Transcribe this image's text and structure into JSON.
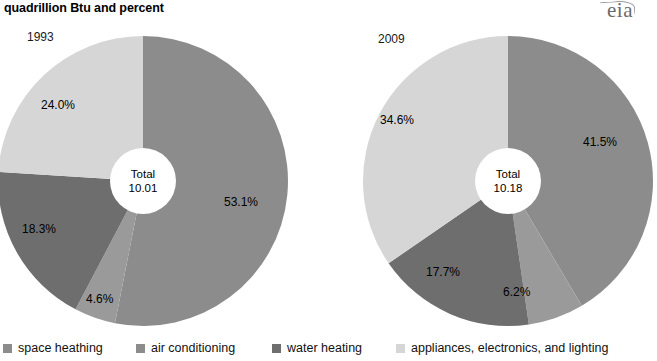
{
  "header": {
    "title": "quadrillion Btu and percent",
    "logo": "eia"
  },
  "legend": {
    "items": [
      {
        "label": "space heathing",
        "color": "#8c8c8c"
      },
      {
        "label": "air conditioning",
        "color": "#8c8c8c"
      },
      {
        "label": "water heating",
        "color": "#6e6e6e"
      },
      {
        "label": "appliances, electronics, and lighting",
        "color": "#d6d6d6"
      }
    ]
  },
  "chart_data": [
    {
      "type": "pie",
      "title": "1993",
      "center_label_line1": "Total",
      "center_label_line2": "10.01",
      "total": 10.01,
      "categories": [
        "space heathing",
        "air conditioning",
        "water heating",
        "appliances, electronics, and lighting"
      ],
      "values": [
        53.1,
        4.6,
        18.3,
        24.0
      ],
      "labels": [
        "53.1%",
        "4.6%",
        "18.3%",
        "24.0%"
      ],
      "colors": [
        "#8c8c8c",
        "#9a9a9a",
        "#6e6e6e",
        "#d6d6d6"
      ],
      "start_angle_deg": 0,
      "direction": "clockwise",
      "donut": true
    },
    {
      "type": "pie",
      "title": "2009",
      "center_label_line1": "Total",
      "center_label_line2": "10.18",
      "total": 10.18,
      "categories": [
        "space heathing",
        "air conditioning",
        "water heating",
        "appliances, electronics, and lighting"
      ],
      "values": [
        41.5,
        6.2,
        17.7,
        34.6
      ],
      "labels": [
        "41.5%",
        "6.2%",
        "17.7%",
        "34.6%"
      ],
      "colors": [
        "#8c8c8c",
        "#9a9a9a",
        "#6e6e6e",
        "#d6d6d6"
      ],
      "start_angle_deg": 0,
      "direction": "clockwise",
      "donut": true
    }
  ],
  "pies": {
    "left": {
      "year": "1993",
      "center_line1": "Total",
      "center_line2": "10.01",
      "slice_labels": {
        "space_heating": "53.1%",
        "air_conditioning": "4.6%",
        "water_heating": "18.3%",
        "appliances": "24.0%"
      }
    },
    "right": {
      "year": "2009",
      "center_line1": "Total",
      "center_line2": "10.18",
      "slice_labels": {
        "space_heating": "41.5%",
        "air_conditioning": "6.2%",
        "water_heating": "17.7%",
        "appliances": "34.6%"
      }
    }
  }
}
